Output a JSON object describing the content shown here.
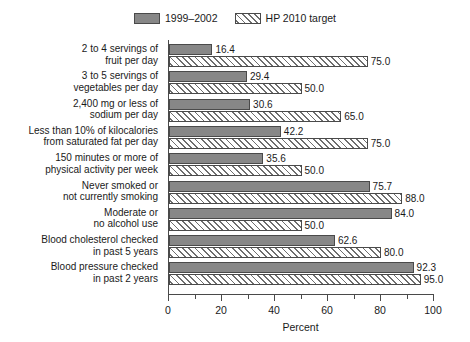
{
  "chart_data": {
    "type": "bar",
    "orientation": "horizontal",
    "title": "",
    "xlabel": "Percent",
    "ylabel": "",
    "xlim": [
      0,
      100
    ],
    "xticks": [
      0,
      20,
      40,
      60,
      80,
      100
    ],
    "xtick_labels": [
      "0",
      "20",
      "40",
      "60",
      "80",
      "100"
    ],
    "minor_tick_step": 10,
    "grid": false,
    "legend_position": "top-center",
    "categories": [
      "2 to 4 servings of\nfruit per day",
      "3 to 5 servings of\nvegetables per day",
      "2,400 mg or less of\nsodium per day",
      "Less than 10% of kilocalories\nfrom saturated fat per day",
      "150 minutes or more of\nphysical activity per week",
      "Never smoked or\nnot currently smoking",
      "Moderate or\nno alcohol use",
      "Blood cholesterol checked\nin past 5 years",
      "Blood pressure checked\nin past 2 years"
    ],
    "series": [
      {
        "name": "1999–2002",
        "style": "solid",
        "color": "#878787",
        "values": [
          16.4,
          29.4,
          30.6,
          42.2,
          35.6,
          75.7,
          84.0,
          62.6,
          92.3
        ],
        "value_labels": [
          "16.4",
          "29.4",
          "30.6",
          "42.2",
          "35.6",
          "75.7",
          "84.0",
          "62.6",
          "92.3"
        ]
      },
      {
        "name": "HP 2010 target",
        "style": "hatched",
        "color": "#ffffff",
        "values": [
          75.0,
          50.0,
          65.0,
          75.0,
          50.0,
          88.0,
          50.0,
          80.0,
          95.0
        ],
        "value_labels": [
          "75.0",
          "50.0",
          "65.0",
          "75.0",
          "50.0",
          "88.0",
          "50.0",
          "80.0",
          "95.0"
        ]
      }
    ]
  },
  "legend": {
    "entries": [
      {
        "label": "1999–2002",
        "style": "solid"
      },
      {
        "label": "HP 2010 target",
        "style": "hatch"
      }
    ]
  },
  "axis": {
    "x_title": "Percent"
  },
  "colors": {
    "bar_fill": "#878787",
    "bar_stroke": "#4a4a4a",
    "hatch_line": "#6e6e6e",
    "text": "#1a1a1a",
    "background": "#ffffff"
  }
}
